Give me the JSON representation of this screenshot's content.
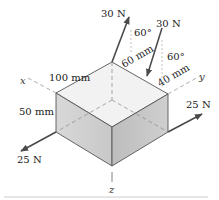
{
  "figure": {
    "type": "statics-diagram",
    "axes": {
      "x": "x",
      "y": "y",
      "z": "z"
    },
    "dimensions": {
      "length_x": "100 mm",
      "height_z": "50 mm",
      "offset_a": "60 mm",
      "offset_b": "40 mm"
    },
    "forces": [
      {
        "label": "30 N",
        "angle": "60°",
        "location": "top-back-edge, upward"
      },
      {
        "label": "30 N",
        "angle": "60°",
        "location": "top-right-edge, downward"
      },
      {
        "label": "25 N",
        "location": "bottom-left corner, along x"
      },
      {
        "label": "25 N",
        "location": "bottom-right corner, along y"
      }
    ],
    "colors": {
      "block_top": "#f2f2f2",
      "block_left": "#d0d0d0",
      "block_right": "#c2c2c2",
      "force": "#4a4a4a",
      "rule": "#cccccc"
    }
  }
}
